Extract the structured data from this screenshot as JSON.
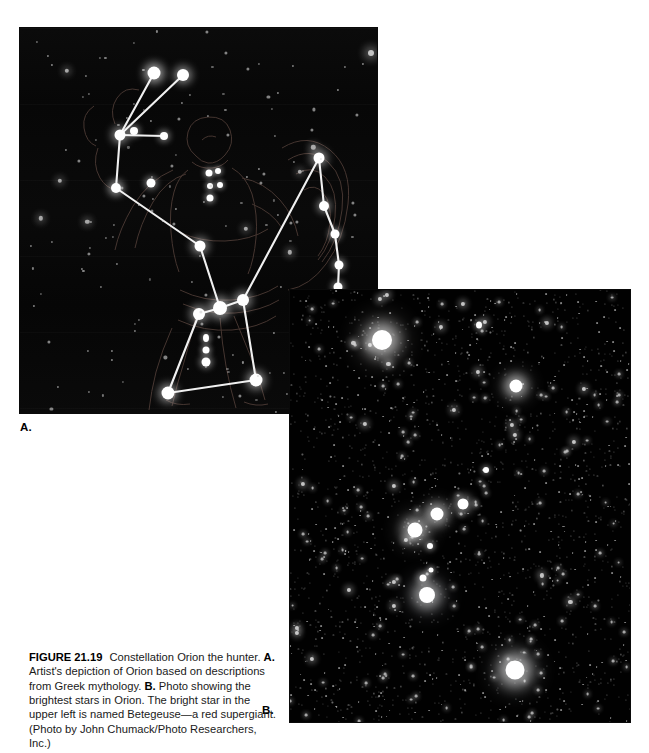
{
  "figure": {
    "number": "FIGURE 21.19",
    "title_text": "Constellation Orion the hunter.",
    "panel_a_tag": "A.",
    "panel_a_text": "Artist's depiction of Orion based on descriptions from Greek mythology.",
    "panel_b_tag": "B.",
    "panel_b_text": "Photo showing the brightest stars in Orion. The bright star in the upper left is named Betegeuse—a red supergiant.",
    "credit": "(Photo by John Chumack/Photo Researchers, Inc.)"
  },
  "labels": {
    "panel_a": "A.",
    "panel_b": "B."
  },
  "panels": {
    "a": {
      "name": "artist-depiction-of-orion",
      "caption_role": "Artist's depiction of Orion based on descriptions from Greek mythology",
      "background": "#080808",
      "star_color": "#ffffff",
      "line_color": "#f2f2f2",
      "outline_color": "#8a6a5e"
    },
    "b": {
      "name": "photograph-of-orion",
      "caption_role": "Photo showing the brightest stars in Orion",
      "background": "#010101",
      "star_color": "#ffffff",
      "credit": "John Chumack/Photo Researchers, Inc."
    }
  },
  "chart_data": {
    "type": "scatter",
    "title": "Constellation Orion the hunter",
    "xlabel": "",
    "ylabel": "",
    "panel_a_stars": [
      {
        "name": "Betelgeuse",
        "x": 96,
        "y": 160,
        "mag_px": 11
      },
      {
        "name": "club-upper-left",
        "x": 134,
        "y": 45,
        "mag_px": 9
      },
      {
        "name": "club-upper-right",
        "x": 163,
        "y": 47,
        "mag_px": 8
      },
      {
        "name": "club-joint",
        "x": 100,
        "y": 107,
        "mag_px": 7
      },
      {
        "name": "shoulder-left",
        "x": 131,
        "y": 155,
        "mag_px": 8
      },
      {
        "name": "shoulder-knot",
        "x": 144,
        "y": 108,
        "mag_px": 6
      },
      {
        "name": "Bellatrix",
        "x": 299,
        "y": 130,
        "mag_px": 8
      },
      {
        "name": "arm-right-1",
        "x": 304,
        "y": 178,
        "mag_px": 7
      },
      {
        "name": "arm-right-2",
        "x": 315,
        "y": 206,
        "mag_px": 6
      },
      {
        "name": "arm-right-3",
        "x": 319,
        "y": 237,
        "mag_px": 6
      },
      {
        "name": "arm-right-4",
        "x": 318,
        "y": 259,
        "mag_px": 6
      },
      {
        "name": "hand-right",
        "x": 290,
        "y": 300,
        "mag_px": 7
      },
      {
        "name": "belt-left",
        "x": 223,
        "y": 272,
        "mag_px": 8
      },
      {
        "name": "belt-mid",
        "x": 200,
        "y": 280,
        "mag_px": 9
      },
      {
        "name": "belt-right",
        "x": 179,
        "y": 286,
        "mag_px": 8
      },
      {
        "name": "sword-1",
        "x": 186,
        "y": 310,
        "mag_px": 5
      },
      {
        "name": "sword-2",
        "x": 186,
        "y": 322,
        "mag_px": 5
      },
      {
        "name": "sword-3",
        "x": 186,
        "y": 334,
        "mag_px": 6
      },
      {
        "name": "Saiph",
        "x": 236,
        "y": 352,
        "mag_px": 9
      },
      {
        "name": "Rigel",
        "x": 148,
        "y": 365,
        "mag_px": 9
      },
      {
        "name": "waist",
        "x": 180,
        "y": 218,
        "mag_px": 7
      }
    ],
    "panel_a_lines": [
      [
        "club-upper-left",
        "club-joint"
      ],
      [
        "club-upper-right",
        "club-joint"
      ],
      [
        "club-joint",
        "shoulder-knot"
      ],
      [
        "club-joint",
        "Betelgeuse"
      ],
      [
        "Betelgeuse",
        "waist"
      ],
      [
        "waist",
        "belt-mid"
      ],
      [
        "belt-right",
        "belt-mid"
      ],
      [
        "belt-mid",
        "belt-left"
      ],
      [
        "belt-left",
        "Bellatrix"
      ],
      [
        "Bellatrix",
        "arm-right-1"
      ],
      [
        "arm-right-1",
        "arm-right-2"
      ],
      [
        "arm-right-2",
        "arm-right-3"
      ],
      [
        "arm-right-3",
        "arm-right-4"
      ],
      [
        "arm-right-4",
        "hand-right"
      ],
      [
        "belt-right",
        "Rigel"
      ],
      [
        "belt-left",
        "Saiph"
      ],
      [
        "Rigel",
        "Saiph"
      ]
    ],
    "panel_b_bright_stars": [
      {
        "name": "Betelgeuse",
        "x": 92,
        "y": 50,
        "mag_px": 17
      },
      {
        "name": "Bellatrix",
        "x": 226,
        "y": 96,
        "mag_px": 11
      },
      {
        "name": "Alnitak",
        "x": 125,
        "y": 240,
        "mag_px": 12
      },
      {
        "name": "Alnilam",
        "x": 147,
        "y": 224,
        "mag_px": 11
      },
      {
        "name": "Mintaka",
        "x": 173,
        "y": 214,
        "mag_px": 9
      },
      {
        "name": "Orion Nebula",
        "x": 137,
        "y": 305,
        "mag_px": 13
      },
      {
        "name": "Rigel",
        "x": 225,
        "y": 380,
        "mag_px": 16
      }
    ]
  }
}
